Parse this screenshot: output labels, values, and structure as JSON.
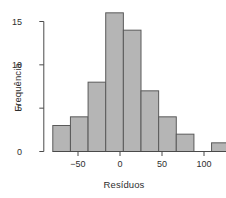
{
  "chart_data": {
    "type": "bar",
    "title": "",
    "subtitle": "",
    "xlabel": "Resíduos",
    "ylabel": "Frequência",
    "xlim": [
      -80,
      130
    ],
    "ylim": [
      0,
      16
    ],
    "grid": false,
    "legend": null,
    "bin_width": 21,
    "bin_edges": [
      -80,
      -59,
      -38,
      -17,
      4,
      25,
      46,
      67,
      88,
      109,
      130
    ],
    "bin_centers": [
      -69.5,
      -48.5,
      -27.5,
      -6.5,
      14.5,
      35.5,
      56.5,
      77.5,
      98.5,
      119.5
    ],
    "values": [
      3,
      4,
      8,
      16,
      14,
      7,
      4,
      2,
      0,
      1
    ],
    "categories": [
      "-80 to -59",
      "-59 to -38",
      "-38 to -17",
      "-17 to 4",
      "4 to 25",
      "25 to 46",
      "46 to 67",
      "67 to 88",
      "88 to 109",
      "109 to 130"
    ],
    "x_ticks": [
      -50,
      0,
      50,
      100
    ],
    "x_tick_labels": [
      "−50",
      "0",
      "50",
      "100"
    ],
    "y_ticks": [
      0,
      5,
      10,
      15
    ],
    "y_tick_labels": [
      "0",
      "5",
      "10",
      "15"
    ],
    "bar_fill_color": "#b5b5b5",
    "bar_edge_color": "#5a5a5a",
    "axis_color": "#4a4a4a",
    "text_color": "#2e2e2e",
    "background_color": "#ffffff"
  }
}
